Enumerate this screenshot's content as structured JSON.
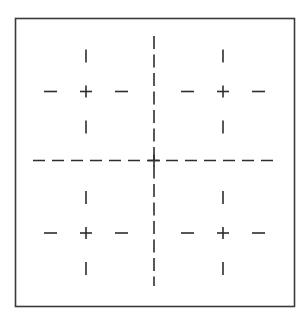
{
  "diagram": {
    "colors": {
      "background": "#ffffff",
      "stroke": "#2e2e2e",
      "frame": "#3a3a3a"
    },
    "frame": {
      "x": 15.5,
      "y": 18.5,
      "width": 279,
      "height": 288,
      "stroke_width": 1.6
    },
    "center_lines": {
      "vertical": {
        "x": 154,
        "y1": 36,
        "y2": 286,
        "dash": 13,
        "gap": 5.5
      },
      "horizontal": {
        "y": 160.5,
        "x1": 33,
        "x2": 277,
        "dash": 12,
        "gap": 7
      },
      "stroke_width": 1.6
    },
    "quadrants": [
      {
        "name": "top-left",
        "cx": 86,
        "cy": 91.5
      },
      {
        "name": "top-right",
        "cx": 223,
        "cy": 91.5
      },
      {
        "name": "bottom-left",
        "cx": 86,
        "cy": 233
      },
      {
        "name": "bottom-right",
        "cx": 223,
        "cy": 233
      }
    ],
    "quadrant_marks": {
      "plus_arm": 6,
      "dash_length": 13,
      "dash_offset_near": 29,
      "dash_offset_far": 42,
      "stroke_width": 1.6
    }
  }
}
